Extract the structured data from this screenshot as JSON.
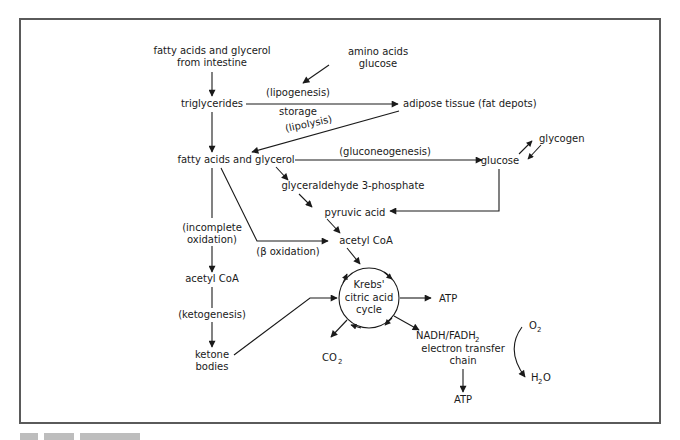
{
  "diagram": {
    "type": "metabolic-pathway",
    "nodes": {
      "fa_intestine": [
        "fatty acids and glycerol",
        "from intestine"
      ],
      "amino_glucose": [
        "amino acids",
        "glucose"
      ],
      "triglycerides": "triglycerides",
      "adipose": "adipose tissue (fat depots)",
      "fa_glycerol": "fatty acids and glycerol",
      "glucose": "glucose",
      "glycogen": "glycogen",
      "g3p": "glyceraldehyde 3-phosphate",
      "pyruvic": "pyruvic acid",
      "acetyl_main": "acetyl CoA",
      "acetyl_side": "acetyl CoA",
      "ketone": [
        "ketone",
        "bodies"
      ],
      "krebs": [
        "Krebs'",
        "citric acid",
        "cycle"
      ],
      "atp_krebs": "ATP",
      "co2": {
        "base": "CO",
        "sub": "2"
      },
      "nadh": {
        "base": "NADH/FADH",
        "sub": "2"
      },
      "etc": [
        "electron transfer",
        "chain"
      ],
      "atp_etc": "ATP",
      "o2": {
        "base": "O",
        "sub": "2"
      },
      "h2o": {
        "pre": "H",
        "sub": "2",
        "post": "O"
      }
    },
    "edge_labels": {
      "lipogenesis": "(lipogenesis)",
      "storage": "storage",
      "lipolysis": "(lipolysis)",
      "gluconeogenesis": "(gluconeogenesis)",
      "incomplete_oxidation": [
        "(incomplete",
        "oxidation)"
      ],
      "beta_oxidation": "(β oxidation)",
      "ketogenesis": "(ketogenesis)"
    },
    "edges": [
      {
        "from": "fatty acids and glycerol from intestine",
        "to": "triglycerides"
      },
      {
        "from": "amino acids / glucose",
        "to": "triglycerides",
        "label": "(lipogenesis)"
      },
      {
        "from": "triglycerides",
        "to": "adipose tissue (fat depots)",
        "label": "storage"
      },
      {
        "from": "adipose tissue (fat depots)",
        "to": "fatty acids and glycerol",
        "label": "(lipolysis)"
      },
      {
        "from": "triglycerides",
        "to": "fatty acids and glycerol"
      },
      {
        "from": "fatty acids and glycerol",
        "to": "glucose",
        "label": "(gluconeogenesis)"
      },
      {
        "from": "glucose",
        "to": "glycogen",
        "bidirectional": true
      },
      {
        "from": "fatty acids and glycerol",
        "to": "glyceraldehyde 3-phosphate"
      },
      {
        "from": "glyceraldehyde 3-phosphate",
        "to": "pyruvic acid"
      },
      {
        "from": "glucose",
        "to": "pyruvic acid"
      },
      {
        "from": "pyruvic acid",
        "to": "acetyl CoA"
      },
      {
        "from": "fatty acids and glycerol",
        "to": "acetyl CoA",
        "label": "(β oxidation)"
      },
      {
        "from": "fatty acids and glycerol",
        "to": "acetyl CoA (side)",
        "label": "(incomplete oxidation)"
      },
      {
        "from": "acetyl CoA (side)",
        "to": "ketone bodies",
        "label": "(ketogenesis)"
      },
      {
        "from": "ketone bodies",
        "to": "Krebs' citric acid cycle"
      },
      {
        "from": "acetyl CoA",
        "to": "Krebs' citric acid cycle"
      },
      {
        "from": "Krebs' citric acid cycle",
        "to": "ATP"
      },
      {
        "from": "Krebs' citric acid cycle",
        "to": "CO2"
      },
      {
        "from": "Krebs' citric acid cycle",
        "to": "NADH/FADH2 electron transfer chain"
      },
      {
        "from": "NADH/FADH2 electron transfer chain",
        "to": "ATP"
      },
      {
        "from": "O2",
        "to": "H2O"
      }
    ]
  },
  "colors": {
    "ink": "#1a1a1a",
    "frame": "#5a5a5a",
    "background": "#ffffff"
  }
}
